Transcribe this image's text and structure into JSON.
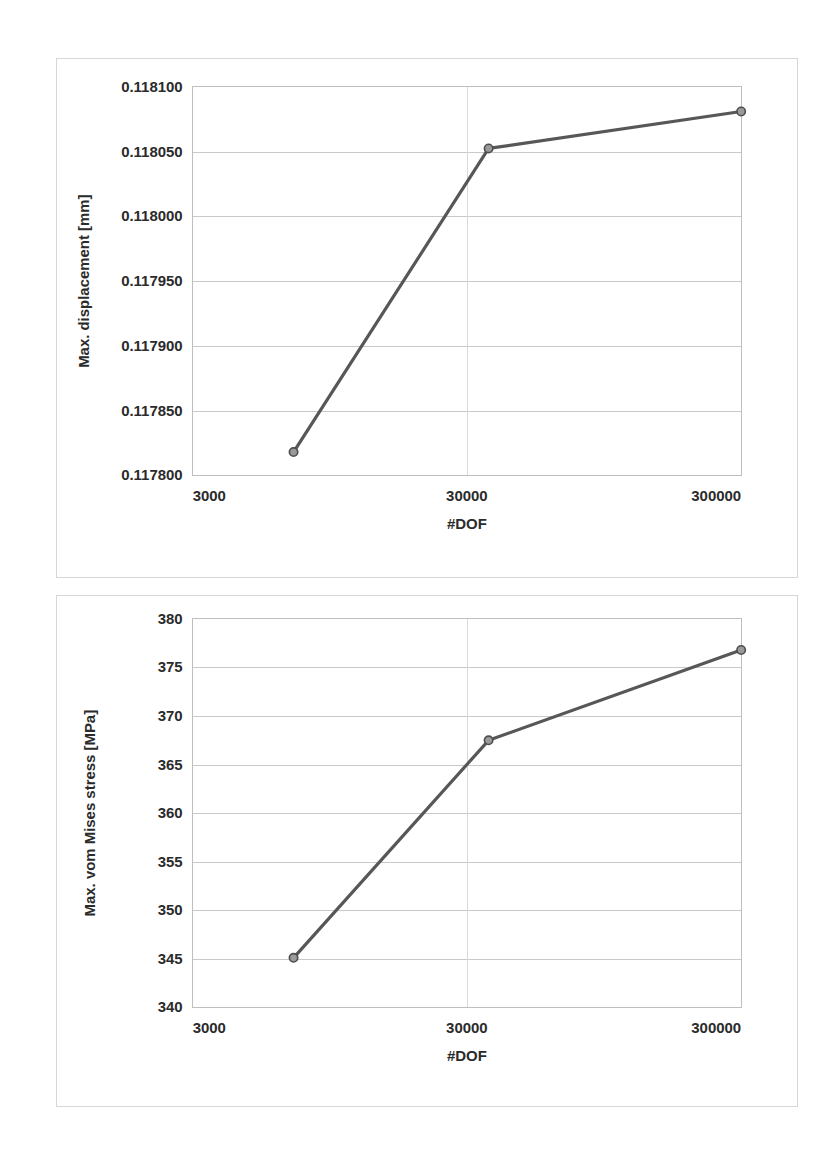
{
  "page": {
    "background_color": "#ffffff",
    "width": 831,
    "height": 1166
  },
  "charts": [
    {
      "id": "displacement",
      "name": "max-displacement-convergence-chart"
    },
    {
      "id": "stress",
      "name": "max-von-mises-stress-convergence-chart"
    }
  ],
  "chart_data": [
    {
      "type": "line",
      "title": "",
      "xlabel": "#DOF",
      "ylabel": "Max. displacement [mm]",
      "xscale": "log",
      "yscale": "linear",
      "xlim": [
        3000,
        300000
      ],
      "ylim": [
        0.1178,
        0.1181
      ],
      "xticks": [
        3000,
        30000,
        300000
      ],
      "xticklabels": [
        "3000",
        "30000",
        "300000"
      ],
      "yticks": [
        0.1178,
        0.11785,
        0.1179,
        0.11795,
        0.118,
        0.11805,
        0.1181
      ],
      "yticklabels": [
        "0.117800",
        "0.117850",
        "0.117900",
        "0.117950",
        "0.118000",
        "0.118050",
        "0.118100"
      ],
      "grid": true,
      "legend": "none",
      "marker": "circle",
      "line_color": "#575757",
      "marker_fill": "#9a9a9a",
      "marker_edge": "#4d4d4d",
      "series": [
        {
          "name": "Max. displacement",
          "x": [
            7000,
            36000,
            300000
          ],
          "y": [
            0.117818,
            0.1180525,
            0.118081
          ]
        }
      ]
    },
    {
      "type": "line",
      "title": "",
      "xlabel": "#DOF",
      "ylabel": "Max. vom Mises stress [MPa]",
      "xscale": "log",
      "yscale": "linear",
      "xlim": [
        3000,
        300000
      ],
      "ylim": [
        340,
        380
      ],
      "xticks": [
        3000,
        30000,
        300000
      ],
      "xticklabels": [
        "3000",
        "30000",
        "300000"
      ],
      "yticks": [
        340,
        345,
        350,
        355,
        360,
        365,
        370,
        375,
        380
      ],
      "yticklabels": [
        "340",
        "345",
        "350",
        "355",
        "360",
        "365",
        "370",
        "375",
        "380"
      ],
      "grid": true,
      "legend": "none",
      "marker": "circle",
      "line_color": "#575757",
      "marker_fill": "#9a9a9a",
      "marker_edge": "#4d4d4d",
      "series": [
        {
          "name": "Max. vom Mises stress",
          "x": [
            7000,
            36000,
            300000
          ],
          "y": [
            345.1,
            367.5,
            376.8
          ]
        }
      ]
    }
  ]
}
